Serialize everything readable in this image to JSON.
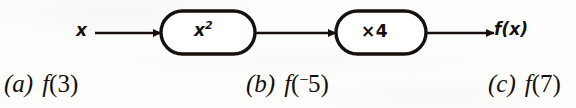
{
  "figure": {
    "type": "function-machine-diagram",
    "input_label": "x",
    "output_label": "f(x)",
    "machines": [
      {
        "id": "square",
        "label_base": "x",
        "label_exponent": "2",
        "icon": "stadium-box"
      },
      {
        "id": "times-four",
        "label": "×4",
        "icon": "stadium-box"
      }
    ],
    "arrows": [
      {
        "name": "input-arrow",
        "from": "x",
        "to": "square-box"
      },
      {
        "name": "middle-arrow",
        "from": "square-box",
        "to": "times-four-box"
      },
      {
        "name": "output-arrow",
        "from": "times-four-box",
        "to": "f(x)"
      }
    ],
    "stroke_color": "#15100d",
    "fill_color": "#ffffff"
  },
  "exercises": [
    {
      "marker": "(a)",
      "func": "f",
      "open": "(",
      "neg": "",
      "value": "3",
      "close": ")"
    },
    {
      "marker": "(b)",
      "func": "f",
      "open": "(",
      "neg": "−",
      "value": "5",
      "close": ")"
    },
    {
      "marker": "(c)",
      "func": "f",
      "open": "(",
      "neg": "",
      "value": "7",
      "close": ")"
    }
  ]
}
